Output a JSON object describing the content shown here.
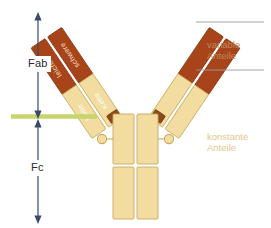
{
  "diagram": {
    "type": "antibody-structure",
    "colors": {
      "variable_region": "#A8441A",
      "variable_region_light": "#B8541F",
      "constant_region": "#F2DCA0",
      "constant_region_stroke": "#C8A95E",
      "hinge_connector": "#8B4A18",
      "cleavage_line": "#C6D66A",
      "arrow": "#3a4a6b",
      "leader_line": "#9a9a9a",
      "text_dark": "#2b2b2b",
      "text_variable_label": "#c08a5a",
      "text_constant_label": "#e3c88a"
    }
  },
  "region_labels": {
    "fab": "Fab",
    "fc": "Fc"
  },
  "annotations": {
    "variable_line1": "variable",
    "variable_line2": "Anteile",
    "constant_line1": "konstante",
    "constant_line2": "Anteile"
  },
  "chain_labels": {
    "heavy_variable": "schwere",
    "light_variable": "leichte",
    "heavy_constant": "Kette",
    "light_constant": "Kette"
  },
  "structure": {
    "arms": 2,
    "glycosylation_sites": 2,
    "domains_per_heavy_chain": 4,
    "domains_per_light_chain": 2
  }
}
